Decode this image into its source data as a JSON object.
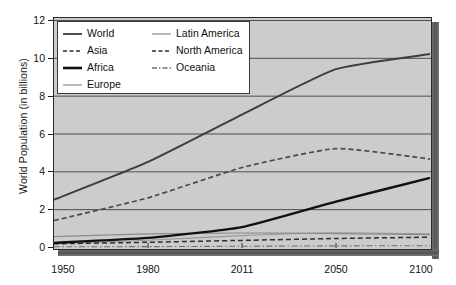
{
  "chart_data": {
    "type": "line",
    "title": "",
    "xlabel": "",
    "ylabel": "World Population (in billions)",
    "x": [
      1950,
      1980,
      2011,
      2050,
      2100
    ],
    "xtick_labels": [
      "1950",
      "1980",
      "2011",
      "2050",
      "2100"
    ],
    "ytick_labels": [
      "0",
      "2",
      "4",
      "6",
      "8",
      "10",
      "12"
    ],
    "yticks": [
      0,
      2,
      4,
      6,
      8,
      10,
      12
    ],
    "ylim": [
      0,
      12
    ],
    "grid": "horizontal",
    "legend_position": "upper-left",
    "plot_background": "#cccccc",
    "series": [
      {
        "name": "World",
        "style": "solid",
        "width": 1.9,
        "color": "#3d3d3d",
        "values": [
          2.5,
          4.5,
          7.0,
          9.4,
          10.2
        ]
      },
      {
        "name": "Asia",
        "style": "dashed",
        "width": 1.7,
        "color": "#4a4a4a",
        "values": [
          1.4,
          2.6,
          4.2,
          5.2,
          4.65
        ]
      },
      {
        "name": "Africa",
        "style": "solid",
        "width": 2.4,
        "color": "#111111",
        "values": [
          0.22,
          0.48,
          1.05,
          2.4,
          3.65
        ]
      },
      {
        "name": "Europe",
        "style": "solid",
        "width": 1.2,
        "color": "#8c8c8c",
        "values": [
          0.55,
          0.69,
          0.74,
          0.71,
          0.65
        ]
      },
      {
        "name": "Latin America",
        "style": "solid",
        "width": 1.1,
        "color": "#9a9a9a",
        "values": [
          0.17,
          0.36,
          0.6,
          0.75,
          0.7
        ]
      },
      {
        "name": "North America",
        "style": "dashed",
        "width": 1.5,
        "color": "#2e2e2e",
        "values": [
          0.17,
          0.25,
          0.35,
          0.45,
          0.52
        ]
      },
      {
        "name": "Oceania",
        "style": "dashdot",
        "width": 1.1,
        "color": "#6e6e6e",
        "values": [
          0.01,
          0.02,
          0.04,
          0.06,
          0.07
        ]
      }
    ],
    "legend_entries": [
      {
        "label": "World",
        "style": "solid",
        "column": 1
      },
      {
        "label": "Asia",
        "style": "dashed",
        "column": 1
      },
      {
        "label": "Africa",
        "style": "solid-bold",
        "column": 1
      },
      {
        "label": "Europe",
        "style": "solid-light",
        "column": 1
      },
      {
        "label": "Latin America",
        "style": "solid-light",
        "column": 2
      },
      {
        "label": "North America",
        "style": "dashed",
        "column": 2
      },
      {
        "label": "Oceania",
        "style": "dashdot",
        "column": 2
      }
    ]
  }
}
